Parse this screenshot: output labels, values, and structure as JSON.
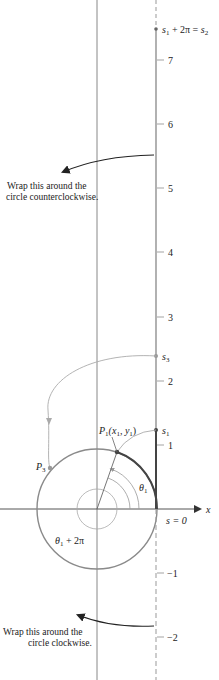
{
  "diagram": {
    "axes": {
      "x_label": "x",
      "origin_label": "s = 0"
    },
    "number_line": {
      "ticks": [
        {
          "value": "7",
          "y": 60
        },
        {
          "value": "6",
          "y": 124
        },
        {
          "value": "5",
          "y": 188
        },
        {
          "value": "4",
          "y": 252
        },
        {
          "value": "3",
          "y": 317
        },
        {
          "value": "2",
          "y": 381
        },
        {
          "value": "1",
          "y": 445
        },
        {
          "value": "−1",
          "y": 573
        },
        {
          "value": "−2",
          "y": 637
        }
      ],
      "points": {
        "s1": {
          "label": "s",
          "sub": "1"
        },
        "s3": {
          "label": "s",
          "sub": "3"
        },
        "s2": {
          "label_a": "s",
          "sub_a": "1",
          "mid": " + 2π = ",
          "label_b": "s",
          "sub_b": "2"
        }
      }
    },
    "circle_labels": {
      "p1": {
        "name": "P",
        "sub": "1",
        "coords": "(x",
        "coords_sub1": "1",
        "coords_mid": ", y",
        "coords_sub2": "1",
        "coords_end": ")"
      },
      "p3": {
        "name": "P",
        "sub": "3"
      },
      "theta1": {
        "name": "θ",
        "sub": "1"
      },
      "theta1_2pi": {
        "name": "θ",
        "sub": "1",
        "rest": " + 2π"
      }
    },
    "annotations": {
      "ccw_line1": "Wrap this around the",
      "ccw_line2": "circle counterclockwise.",
      "cw_line1": "Wrap this around the",
      "cw_line2": "circle clockwise."
    },
    "colors": {
      "axis": "#555555",
      "circle": "#8a8a8a",
      "light_line": "#a8a8a8",
      "arc_dark": "#444444",
      "text": "#222222"
    }
  }
}
